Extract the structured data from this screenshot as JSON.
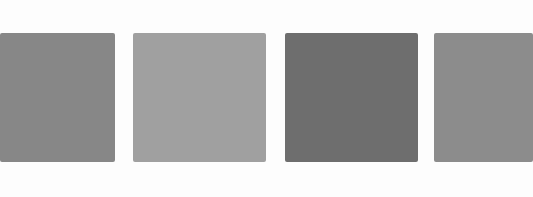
{
  "swatches": [
    {
      "name": "swatch-1",
      "color": "#878787",
      "left": 0,
      "width": 115
    },
    {
      "name": "swatch-2",
      "color": "#a0a0a0",
      "left": 133,
      "width": 133
    },
    {
      "name": "swatch-3",
      "color": "#6e6e6e",
      "left": 285,
      "width": 133
    },
    {
      "name": "swatch-4",
      "color": "#8c8c8c",
      "left": 434,
      "width": 99
    }
  ]
}
